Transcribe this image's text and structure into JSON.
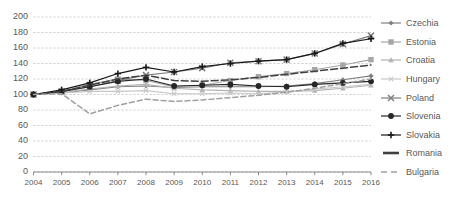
{
  "chart_data": {
    "type": "line",
    "title": "",
    "subtitle": "",
    "xlabel": "",
    "ylabel": "",
    "x": [
      2004,
      2005,
      2006,
      2007,
      2008,
      2009,
      2010,
      2011,
      2012,
      2013,
      2014,
      2015,
      2016
    ],
    "categories": [
      "2004",
      "2005",
      "2006",
      "2007",
      "2008",
      "2009",
      "2010",
      "2011",
      "2012",
      "2013",
      "2014",
      "2015",
      "2016"
    ],
    "xlim": [
      2004,
      2016
    ],
    "ylim": [
      0,
      200
    ],
    "ytick_values": [
      0,
      20,
      40,
      60,
      80,
      100,
      120,
      140,
      160,
      180,
      200
    ],
    "ytick_labels": [
      "0",
      "20",
      "40",
      "60",
      "80",
      "100",
      "120",
      "140",
      "160",
      "180",
      "200"
    ],
    "grid": true,
    "grid_style": "dashed-horizontal",
    "legend_position": "right",
    "series": [
      {
        "name": "Czechia",
        "marker": "diamond",
        "color": "#808080",
        "dash": "solid",
        "values": [
          100,
          102,
          106,
          110,
          111,
          109,
          110,
          110,
          110,
          111,
          114,
          119,
          124
        ]
      },
      {
        "name": "Estonia",
        "marker": "square",
        "color": "#a6a6a6",
        "dash": "solid",
        "values": [
          100,
          104,
          113,
          120,
          118,
          110,
          112,
          118,
          123,
          127,
          132,
          138,
          145
        ]
      },
      {
        "name": "Croatia",
        "marker": "triangle",
        "color": "#b3b3b3",
        "dash": "solid",
        "values": [
          100,
          103,
          107,
          111,
          113,
          108,
          106,
          105,
          104,
          104,
          105,
          108,
          112
        ]
      },
      {
        "name": "Hungary",
        "marker": "x-light",
        "color": "#c8c8c8",
        "dash": "solid",
        "values": [
          100,
          102,
          104,
          104,
          105,
          101,
          101,
          102,
          101,
          103,
          107,
          110,
          113
        ]
      },
      {
        "name": "Poland",
        "marker": "x",
        "color": "#7f7f7f",
        "dash": "solid",
        "values": [
          100,
          104,
          110,
          118,
          125,
          129,
          134,
          141,
          143,
          145,
          153,
          165,
          176
        ]
      },
      {
        "name": "Slovenia",
        "marker": "circle",
        "color": "#262626",
        "dash": "solid",
        "values": [
          100,
          104,
          110,
          117,
          120,
          111,
          112,
          113,
          111,
          110,
          113,
          115,
          117
        ]
      },
      {
        "name": "Slovakia",
        "marker": "plus",
        "color": "#1a1a1a",
        "dash": "solid",
        "values": [
          100,
          106,
          115,
          127,
          135,
          129,
          136,
          140,
          143,
          145,
          153,
          166,
          172
        ]
      },
      {
        "name": "Romania",
        "marker": "dash",
        "color": "#404040",
        "dash": "dashed-long",
        "values": [
          100,
          104,
          112,
          120,
          125,
          118,
          117,
          119,
          122,
          126,
          130,
          134,
          138
        ]
      },
      {
        "name": "Bulgaria",
        "marker": "dash-light",
        "color": "#a0a0a0",
        "dash": "dashed",
        "values": [
          100,
          101,
          75,
          86,
          94,
          91,
          93,
          96,
          99,
          103,
          108,
          114,
          120
        ]
      }
    ]
  }
}
